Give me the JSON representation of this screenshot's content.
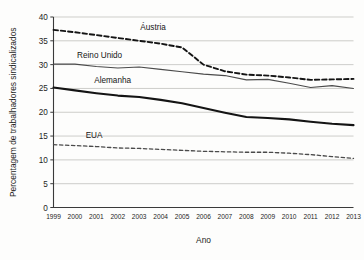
{
  "chart_data": {
    "type": "line",
    "title": "",
    "xlabel": "Ano",
    "ylabel": "Percentagem de trabalhadores sindicalizados",
    "x": [
      1999,
      2000,
      2001,
      2002,
      2003,
      2004,
      2005,
      2006,
      2007,
      2008,
      2009,
      2010,
      2011,
      2012,
      2013
    ],
    "categories": [
      "1999",
      "2000",
      "2001",
      "2002",
      "2003",
      "2004",
      "2005",
      "2006",
      "2007",
      "2008",
      "2009",
      "2010",
      "2011",
      "2012",
      "2013"
    ],
    "ylim": [
      0,
      40
    ],
    "yticks": [
      0,
      5,
      10,
      15,
      20,
      25,
      30,
      35,
      40
    ],
    "ytick_labels": [
      "0",
      "5",
      "10",
      "15",
      "20",
      "25",
      "30",
      "35",
      "40"
    ],
    "grid": true,
    "grid_axis": "y",
    "legend": "inline-labels",
    "series": [
      {
        "name": "Áustria",
        "style": "dashed",
        "color": "#141414",
        "width": 1.9,
        "label_x": 2003.05,
        "label_y": 37.2,
        "values": [
          37.3,
          36.8,
          36.2,
          35.6,
          35.0,
          34.4,
          33.6,
          30.0,
          28.6,
          27.9,
          27.7,
          27.3,
          26.8,
          26.9,
          27.0
        ]
      },
      {
        "name": "Reino Unido",
        "style": "solid",
        "color": "#4a4a4a",
        "width": 1.1,
        "label_x": 2000.1,
        "label_y": 31.3,
        "values": [
          30.1,
          30.1,
          29.6,
          29.3,
          29.5,
          29.0,
          28.5,
          28.0,
          27.7,
          26.8,
          26.9,
          26.1,
          25.2,
          25.6,
          25.0
        ]
      },
      {
        "name": "Alemanha",
        "style": "solid",
        "color": "#141414",
        "width": 2.1,
        "label_x": 2000.9,
        "label_y": 26.2,
        "values": [
          25.2,
          24.6,
          24.0,
          23.5,
          23.2,
          22.6,
          21.9,
          20.9,
          19.9,
          19.0,
          18.8,
          18.5,
          18.0,
          17.6,
          17.3
        ]
      },
      {
        "name": "EUA",
        "style": "dashed",
        "color": "#4a4a4a",
        "width": 1.3,
        "label_x": 2000.5,
        "label_y": 14.6,
        "values": [
          13.2,
          13.0,
          12.8,
          12.5,
          12.4,
          12.2,
          12.0,
          11.8,
          11.7,
          11.6,
          11.6,
          11.4,
          11.1,
          10.7,
          10.3
        ]
      }
    ]
  }
}
